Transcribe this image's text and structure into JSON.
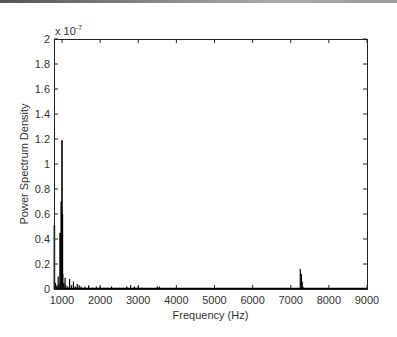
{
  "chart_data": {
    "type": "line",
    "title": "",
    "xlabel": "Frequency (Hz)",
    "ylabel": "Power Spectrum Density",
    "y_multiplier": "x 10^-7",
    "y_multiplier_base": "x 10",
    "y_multiplier_exp": "-7",
    "xlim": [
      790,
      9000
    ],
    "ylim": [
      0,
      2
    ],
    "x_ticks": [
      1000,
      2000,
      3000,
      4000,
      5000,
      6000,
      7000,
      8000,
      9000
    ],
    "x_tick_labels": [
      "1000",
      "2000",
      "3000",
      "4000",
      "5000",
      "6000",
      "7000",
      "8000",
      "9000"
    ],
    "y_ticks": [
      0,
      0.2,
      0.4,
      0.6,
      0.8,
      1,
      1.2,
      1.4,
      1.6,
      1.8,
      2
    ],
    "y_tick_labels": [
      "0",
      "0.2",
      "0.4",
      "0.6",
      "0.8",
      "1",
      "1.2",
      "1.4",
      "1.6",
      "1.8",
      "2"
    ],
    "grid": false,
    "legend": null,
    "series": [
      {
        "name": "PSD",
        "color": "#000000",
        "x": [
          800,
          830,
          850,
          870,
          900,
          920,
          950,
          980,
          1000,
          1010,
          1020,
          1030,
          1050,
          1080,
          1100,
          1150,
          1200,
          1250,
          1300,
          1350,
          1400,
          1450,
          1500,
          1600,
          1700,
          1800,
          1900,
          2000,
          2100,
          2200,
          2300,
          2400,
          2500,
          2600,
          2700,
          2800,
          2900,
          3000,
          3100,
          3200,
          3400,
          3500,
          3550,
          3600,
          3800,
          4000,
          5000,
          6000,
          7000,
          7200,
          7250,
          7280,
          7300,
          7320,
          7350,
          7400,
          8000,
          9000
        ],
        "y": [
          0.51,
          0.05,
          0.02,
          0.03,
          0.1,
          0.04,
          0.45,
          0.7,
          1.19,
          0.6,
          0.12,
          0.04,
          0.05,
          0.09,
          0.03,
          0.02,
          0.08,
          0.03,
          0.06,
          0.02,
          0.04,
          0.03,
          0.02,
          0.02,
          0.03,
          0.01,
          0.02,
          0.02,
          0.01,
          0.01,
          0.02,
          0.01,
          0.01,
          0.01,
          0.02,
          0.03,
          0.02,
          0.02,
          0.01,
          0.0,
          0.0,
          0.02,
          0.02,
          0.0,
          0.0,
          0.0,
          0.0,
          0.0,
          0.0,
          0.0,
          0.16,
          0.12,
          0.06,
          0.02,
          0.0,
          0.0,
          0.0,
          0.0
        ]
      }
    ]
  },
  "plot": {
    "left": 54,
    "top": 39,
    "right": 367,
    "bottom": 289
  }
}
